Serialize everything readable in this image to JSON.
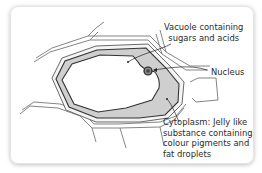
{
  "diagram": {
    "type": "plant-cell-diagram",
    "labels": {
      "vacuole_line1": "Vacuole containing",
      "vacuole_line2": "sugars and acids",
      "nucleus": "Nucleus",
      "cytoplasm_line1": "Cytoplasm: Jelly like",
      "cytoplasm_line2": "substance containing",
      "cytoplasm_line3": "colour pigments and",
      "cytoplasm_line4": "fat droplets"
    },
    "colors": {
      "cytoplasm": "#cfcfcf",
      "membrane": "#3a3a3a",
      "wall": "#7a7a7a",
      "vacuole": "#ffffff",
      "text": "#2a2a2a"
    }
  }
}
